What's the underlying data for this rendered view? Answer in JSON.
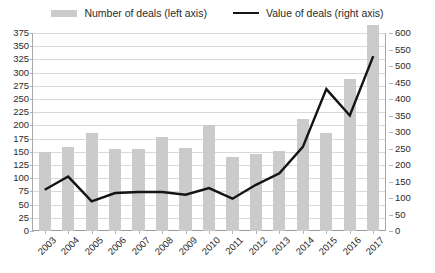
{
  "legend": {
    "bar_label": "Number of deals (left axis)",
    "line_label": "Value of deals (right axis)",
    "bar_swatch_name": "bar-swatch",
    "line_swatch_name": "line-swatch"
  },
  "colors": {
    "bar": "#cbcbcb",
    "line": "#141414",
    "grid": "#d9d9d9",
    "text": "#2b2b2b",
    "background": "#ffffff"
  },
  "chart_data": {
    "type": "bar",
    "title": "",
    "subtitle": "",
    "xlabel": "",
    "ylabel": "",
    "categories": [
      "2003",
      "2004",
      "2005",
      "2006",
      "2007",
      "2008",
      "2009",
      "2010",
      "2011",
      "2012",
      "2013",
      "2014",
      "2015",
      "2016",
      "2017"
    ],
    "grid": true,
    "legend_position": "top-center",
    "axes": {
      "left": {
        "label": "Number of deals",
        "min": 0,
        "max": 375,
        "step": 25,
        "ticks": [
          0,
          25,
          50,
          75,
          100,
          125,
          150,
          175,
          200,
          225,
          250,
          275,
          300,
          325,
          350,
          375
        ],
        "tick_labels": [
          "0",
          "25",
          "50",
          "75",
          "100",
          "125",
          "150",
          "175",
          "200",
          "225",
          "250",
          "275",
          "300",
          "325",
          "350",
          "375"
        ]
      },
      "right": {
        "label": "Value of deals",
        "min": 0,
        "max": 600,
        "step": 50,
        "ticks": [
          0,
          50,
          100,
          150,
          200,
          250,
          300,
          350,
          400,
          450,
          500,
          550,
          600
        ],
        "tick_labels": [
          "0",
          "50",
          "100",
          "150",
          "200",
          "250",
          "300",
          "350",
          "400",
          "450",
          "500",
          "550",
          "600"
        ]
      }
    },
    "series": [
      {
        "name": "Number of deals (left axis)",
        "type": "bar",
        "axis": "left",
        "color": "#cbcbcb",
        "values": [
          150,
          160,
          185,
          155,
          155,
          178,
          158,
          200,
          140,
          145,
          152,
          213,
          185,
          288,
          390
        ]
      },
      {
        "name": "Value of deals (right axis)",
        "type": "line",
        "axis": "right",
        "color": "#141414",
        "values": [
          125,
          165,
          90,
          115,
          118,
          118,
          110,
          130,
          98,
          140,
          175,
          255,
          430,
          350,
          530
        ]
      }
    ]
  }
}
